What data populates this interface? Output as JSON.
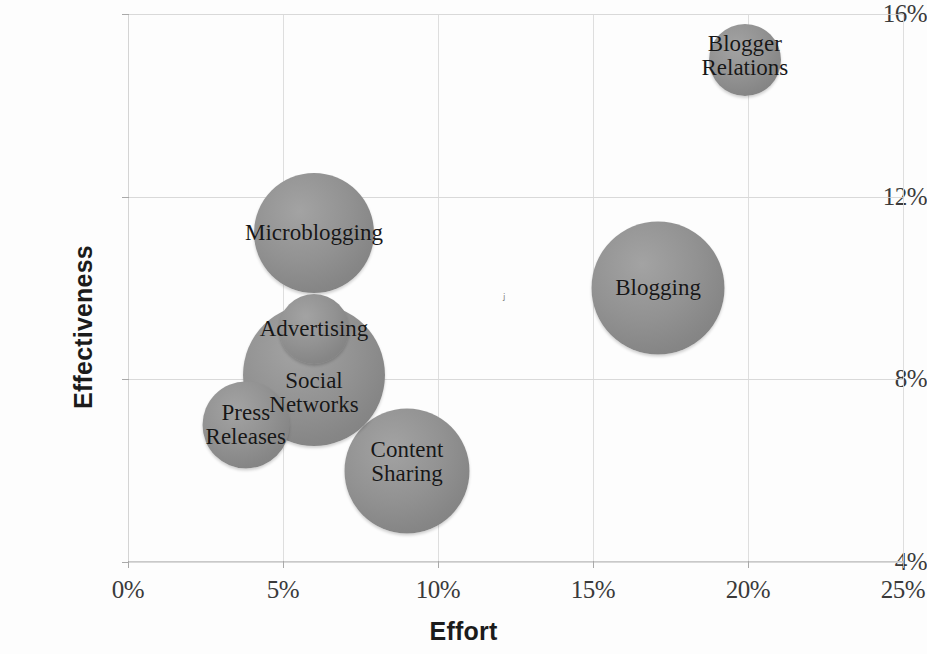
{
  "chart_data": {
    "type": "scatter",
    "subtype": "bubble",
    "title": "",
    "xlabel": "Effort",
    "ylabel": "Effectiveness",
    "xlim": [
      0,
      25
    ],
    "ylim": [
      4,
      16
    ],
    "x_ticks": [
      "0%",
      "5%",
      "10%",
      "15%",
      "20%",
      "25%"
    ],
    "x_tick_values": [
      0,
      5,
      10,
      15,
      20,
      25
    ],
    "y_ticks": [
      "4%",
      "8%",
      "12%",
      "16%"
    ],
    "y_tick_values": [
      4,
      8,
      12,
      16
    ],
    "grid": true,
    "legend": "none",
    "units": "percent",
    "bubble_color": "#8d8d8d",
    "label_color": "#171717",
    "points": [
      {
        "name": "Microblogging",
        "label": "Microblogging",
        "x": 6.0,
        "y": 11.2,
        "size": 120,
        "label_dy": 0,
        "label_dx": 0,
        "z": 10
      },
      {
        "name": "Advertising",
        "label": "Advertising",
        "x": 6.0,
        "y": 9.1,
        "size": 70,
        "label_dy": 0,
        "label_dx": 0,
        "z": 30
      },
      {
        "name": "Social Networks",
        "label": "Social\nNetworks",
        "x": 6.0,
        "y": 8.1,
        "size": 142,
        "label_dy": 18,
        "label_dx": 0,
        "z": 20
      },
      {
        "name": "Press Releases",
        "label": "Press\nReleases",
        "x": 3.8,
        "y": 7.0,
        "size": 87,
        "label_dy": 0,
        "label_dx": 0,
        "z": 25
      },
      {
        "name": "Content Sharing",
        "label": "Content\nSharing",
        "x": 9.0,
        "y": 6.0,
        "size": 125,
        "label_dy": -9,
        "label_dx": 0,
        "z": 15
      },
      {
        "name": "Blogging",
        "label": "Blogging",
        "x": 17.1,
        "y": 10.0,
        "size": 133,
        "label_dy": 0,
        "label_dx": 0,
        "z": 10
      },
      {
        "name": "Blogger Relations",
        "label": "Blogger\nRelations",
        "x": 19.9,
        "y": 15.0,
        "size": 72,
        "label_dy": -4,
        "label_dx": 0,
        "z": 10
      }
    ],
    "artifacts": [
      {
        "name": "scan-speck",
        "glyph": "ⱼ",
        "x": 12.1,
        "y": 10.05
      }
    ]
  }
}
